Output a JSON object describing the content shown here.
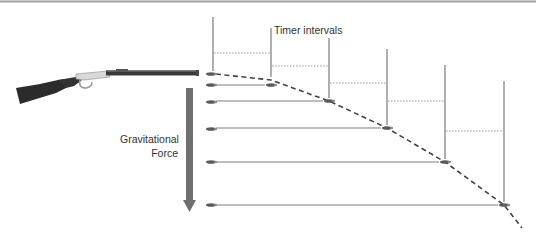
{
  "diagram": {
    "labels": {
      "timer_intervals": "Timer intervals",
      "gravitational_force_line1": "Gravitational",
      "gravitational_force_line2": "Force"
    },
    "colors": {
      "line": "#6e6e6e",
      "dotted": "#9a9a9a",
      "trajectory": "#444444",
      "arrow": "#6f6f6f",
      "bullet": "#5a5a5a",
      "rifle_stock": "#2b2b2b",
      "rifle_receiver": "#d8d8d8",
      "rifle_barrel": "#3a3a3a",
      "top_border": "#9a9a9a"
    },
    "icons": {
      "rifle": "rifle-icon",
      "bullet": "bullet-icon",
      "gravity_arrow": "down-arrow-icon"
    },
    "time_steps": 6
  }
}
